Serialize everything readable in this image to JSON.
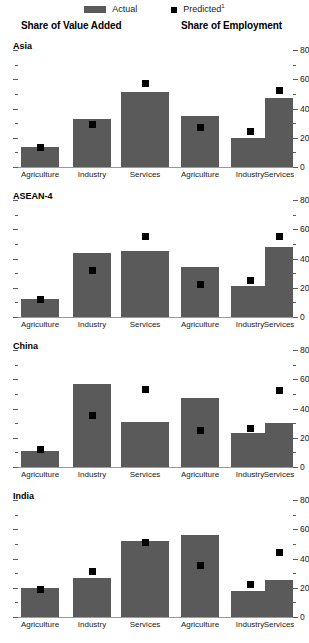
{
  "legend": {
    "actual": {
      "label": "Actual",
      "swatch": "bar-swatch-icon",
      "color": "#5a5a5a"
    },
    "predicted": {
      "label": "Predicted",
      "footnote": "1",
      "swatch": "square-marker-icon",
      "color": "#000000"
    }
  },
  "columns": {
    "left_title": "Share of Value Added",
    "right_title": "Share of Employment"
  },
  "axis": {
    "tick_labels": [
      "0",
      "20",
      "40",
      "60",
      "80"
    ],
    "minor_ticks": [
      10,
      30,
      50,
      70
    ],
    "min": 0,
    "max": 80
  },
  "categories": [
    "Agriculture",
    "Industry",
    "Services"
  ],
  "panels": [
    {
      "title": "Asia"
    },
    {
      "title": "ASEAN-4"
    },
    {
      "title": "China"
    },
    {
      "title": "India"
    }
  ],
  "chart_data": {
    "type": "bar",
    "xlabel": "",
    "ylabel": "",
    "ylim": [
      0,
      80
    ],
    "yticks": [
      0,
      20,
      40,
      60,
      80
    ],
    "grid": false,
    "legend_position": "top-center",
    "categories": [
      "Agriculture",
      "Industry",
      "Services"
    ],
    "panels": [
      {
        "name": "Asia",
        "charts": [
          {
            "title": "Share of Value Added",
            "series": [
              {
                "name": "Actual",
                "type": "bar",
                "values": [
                  14,
                  33,
                  51
                ]
              },
              {
                "name": "Predicted",
                "type": "marker",
                "values": [
                  13,
                  29,
                  57
                ]
              }
            ]
          },
          {
            "title": "Share of Employment",
            "series": [
              {
                "name": "Actual",
                "type": "bar",
                "values": [
                  35,
                  20,
                  47
                ]
              },
              {
                "name": "Predicted",
                "type": "marker",
                "values": [
                  27,
                  24,
                  52
                ]
              }
            ]
          }
        ]
      },
      {
        "name": "ASEAN-4",
        "charts": [
          {
            "title": "Share of Value Added",
            "series": [
              {
                "name": "Actual",
                "type": "bar",
                "values": [
                  12,
                  44,
                  45
                ]
              },
              {
                "name": "Predicted",
                "type": "marker",
                "values": [
                  12,
                  32,
                  55
                ]
              }
            ]
          },
          {
            "title": "Share of Employment",
            "series": [
              {
                "name": "Actual",
                "type": "bar",
                "values": [
                  34,
                  21,
                  48
                ]
              },
              {
                "name": "Predicted",
                "type": "marker",
                "values": [
                  22,
                  25,
                  55
                ]
              }
            ]
          }
        ]
      },
      {
        "name": "China",
        "charts": [
          {
            "title": "Share of Value Added",
            "series": [
              {
                "name": "Actual",
                "type": "bar",
                "values": [
                  11,
                  57,
                  31
                ]
              },
              {
                "name": "Predicted",
                "type": "marker",
                "values": [
                  12,
                  35,
                  53
                ]
              }
            ]
          },
          {
            "title": "Share of Employment",
            "series": [
              {
                "name": "Actual",
                "type": "bar",
                "values": [
                  47,
                  23,
                  30
                ]
              },
              {
                "name": "Predicted",
                "type": "marker",
                "values": [
                  25,
                  26,
                  52
                ]
              }
            ]
          }
        ]
      },
      {
        "name": "India",
        "charts": [
          {
            "title": "Share of Value Added",
            "series": [
              {
                "name": "Actual",
                "type": "bar",
                "values": [
                  20,
                  27,
                  52
                ]
              },
              {
                "name": "Predicted",
                "type": "marker",
                "values": [
                  19,
                  31,
                  51
                ]
              }
            ]
          },
          {
            "title": "Share of Employment",
            "series": [
              {
                "name": "Actual",
                "type": "bar",
                "values": [
                  56,
                  18,
                  25
                ]
              },
              {
                "name": "Predicted",
                "type": "marker",
                "values": [
                  35,
                  22,
                  44
                ]
              }
            ]
          }
        ]
      }
    ]
  }
}
